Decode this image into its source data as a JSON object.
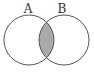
{
  "diagram": {
    "type": "venn",
    "sets": [
      {
        "label": "A",
        "cx": 29,
        "cy": 40,
        "r": 25
      },
      {
        "label": "B",
        "cx": 64,
        "cy": 40,
        "r": 25
      }
    ],
    "shaded_region": "A ∩ B",
    "colors": {
      "stroke": "#555555",
      "shade": "#a9a9a9",
      "background": "#ffffff"
    }
  }
}
